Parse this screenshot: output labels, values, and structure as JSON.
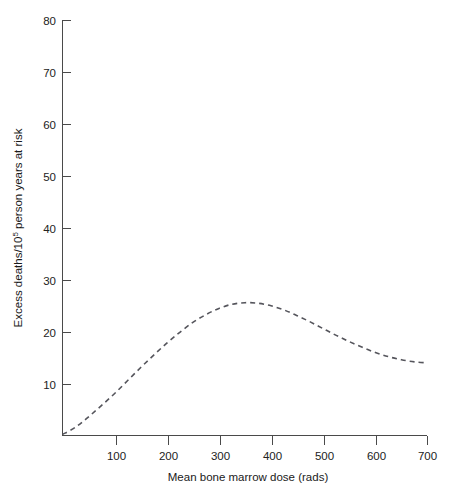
{
  "chart_data": {
    "type": "line",
    "title": "",
    "subtitle": "",
    "xlabel": "Mean bone marrow dose (rads)",
    "ylabel": "Excess deaths/10⁵ person years at risk",
    "ylabel_main": "Excess deaths/10",
    "ylabel_sup": "5",
    "ylabel_tail": " person years at risk",
    "xlim": [
      0,
      700
    ],
    "ylim": [
      0,
      80
    ],
    "grid": false,
    "legend": "none",
    "line_style": "dashed",
    "line_color": "#55555c",
    "axis_color": "#4a4a4a",
    "xticks": [
      100,
      200,
      300,
      400,
      500,
      600,
      700
    ],
    "xtick_labels": [
      "100",
      "200",
      "300",
      "400",
      "500",
      "600",
      "700"
    ],
    "yticks": [
      10,
      20,
      30,
      40,
      50,
      60,
      70,
      80
    ],
    "ytick_labels": [
      "10",
      "20",
      "30",
      "40",
      "50",
      "60",
      "70",
      "80"
    ],
    "series": [
      {
        "name": "Excess deaths",
        "x": [
          0,
          25,
          50,
          75,
          100,
          125,
          150,
          175,
          200,
          225,
          250,
          275,
          300,
          325,
          350,
          375,
          400,
          425,
          450,
          475,
          500,
          525,
          550,
          575,
          600,
          625,
          650,
          675,
          700
        ],
        "values": [
          0.2,
          1.6,
          3.6,
          5.8,
          8.1,
          10.6,
          13.1,
          15.5,
          17.8,
          19.9,
          21.8,
          23.3,
          24.5,
          25.3,
          25.6,
          25.5,
          25.0,
          24.2,
          23.1,
          21.9,
          20.6,
          19.3,
          18.1,
          17.0,
          16.0,
          15.2,
          14.6,
          14.2,
          14.0
        ]
      }
    ],
    "annotations": {
      "peak_dose": 350,
      "peak_value": 25.6,
      "end_value": 14.0
    }
  },
  "figure": {
    "background_color": "#ffffff"
  }
}
